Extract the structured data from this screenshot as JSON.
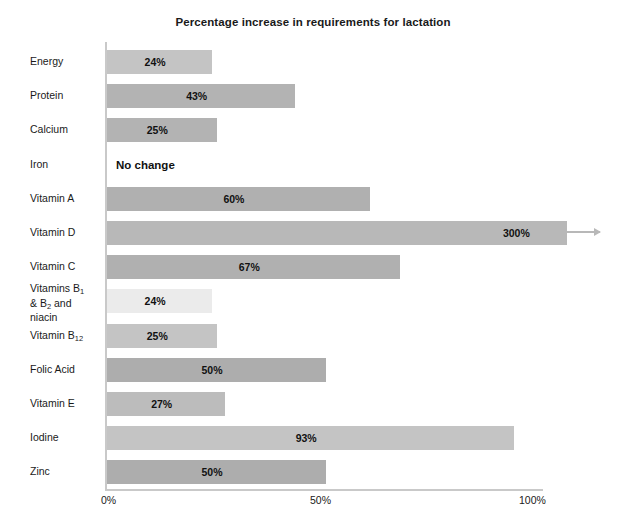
{
  "chart_data": {
    "type": "bar",
    "orientation": "horizontal",
    "title": "Percentage increase in requirements for lactation",
    "xlabel": "",
    "ylabel": "",
    "xlim": [
      0,
      100
    ],
    "grid": false,
    "legend": false,
    "axis_ticks": [
      {
        "value": 0,
        "label": "0%"
      },
      {
        "value": 50,
        "label": "50%"
      },
      {
        "value": 100,
        "label": "100%"
      }
    ],
    "categories": [
      "Energy",
      "Protein",
      "Calcium",
      "Iron",
      "Vitamin A",
      "Vitamin D",
      "Vitamin C",
      "Vitamins B1 & B2 and niacin",
      "Vitamin B12",
      "Folic Acid",
      "Vitamin E",
      "Iodine",
      "Zinc"
    ],
    "values": [
      24,
      43,
      25,
      0,
      60,
      300,
      67,
      24,
      25,
      50,
      27,
      93,
      50
    ],
    "bars": [
      {
        "category": "Energy",
        "value": 24,
        "value_label": "24%",
        "color": "#c4c4c4",
        "overflow": false,
        "no_change": false
      },
      {
        "category": "Protein",
        "value": 43,
        "value_label": "43%",
        "color": "#b3b3b3",
        "overflow": false,
        "no_change": false
      },
      {
        "category": "Calcium",
        "value": 25,
        "value_label": "25%",
        "color": "#b3b3b3",
        "overflow": false,
        "no_change": false
      },
      {
        "category": "Iron",
        "value": 0,
        "value_label": "No change",
        "color": "#ffffff",
        "overflow": false,
        "no_change": true
      },
      {
        "category": "Vitamin A",
        "value": 60,
        "value_label": "60%",
        "color": "#b0b0b0",
        "overflow": false,
        "no_change": false
      },
      {
        "category": "Vitamin D",
        "value": 300,
        "value_label": "300%",
        "color": "#b8b8b8",
        "overflow": true,
        "no_change": false
      },
      {
        "category": "Vitamin C",
        "value": 67,
        "value_label": "67%",
        "color": "#b0b0b0",
        "overflow": false,
        "no_change": false
      },
      {
        "category": "Vitamins B1 & B2 and niacin",
        "value": 24,
        "value_label": "24%",
        "color": "#ebebeb",
        "overflow": false,
        "no_change": false
      },
      {
        "category": "Vitamin B12",
        "value": 25,
        "value_label": "25%",
        "color": "#c4c4c4",
        "overflow": false,
        "no_change": false
      },
      {
        "category": "Folic Acid",
        "value": 50,
        "value_label": "50%",
        "color": "#adadad",
        "overflow": false,
        "no_change": false
      },
      {
        "category": "Vitamin E",
        "value": 27,
        "value_label": "27%",
        "color": "#bcbcbc",
        "overflow": false,
        "no_change": false
      },
      {
        "category": "Iodine",
        "value": 93,
        "value_label": "93%",
        "color": "#c4c4c4",
        "overflow": false,
        "no_change": false
      },
      {
        "category": "Zinc",
        "value": 50,
        "value_label": "50%",
        "color": "#adadad",
        "overflow": false,
        "no_change": false
      }
    ]
  },
  "labels": {
    "row_0": {
      "text": "Energy",
      "html": "Energy"
    },
    "row_1": {
      "text": "Protein",
      "html": "Protein"
    },
    "row_2": {
      "text": "Calcium",
      "html": "Calcium"
    },
    "row_3": {
      "text": "Iron",
      "html": "Iron"
    },
    "row_4": {
      "text": "Vitamin A",
      "html": "Vitamin A"
    },
    "row_5": {
      "text": "Vitamin D",
      "html": "Vitamin D"
    },
    "row_6": {
      "text": "Vitamin C",
      "html": "Vitamin C"
    },
    "row_7": {
      "text": "Vitamins B1 & B2 and niacin",
      "html": "Vitamins B<sub>1</sub><br>&amp; B<sub>2</sub> and<br>niacin"
    },
    "row_8": {
      "text": "Vitamin B12",
      "html": "Vitamin B<sub>12</sub>"
    },
    "row_9": {
      "text": "Folic Acid",
      "html": "Folic Acid"
    },
    "row_10": {
      "text": "Vitamin E",
      "html": "Vitamin E"
    },
    "row_11": {
      "text": "Iodine",
      "html": "Iodine"
    },
    "row_12": {
      "text": "Zinc",
      "html": "Zinc"
    }
  },
  "values": {
    "row_0": "24%",
    "row_1": "43%",
    "row_2": "25%",
    "row_3": "No change",
    "row_4": "60%",
    "row_5": "300%",
    "row_6": "67%",
    "row_7": "24%",
    "row_8": "25%",
    "row_9": "50%",
    "row_10": "27%",
    "row_11": "93%",
    "row_12": "50%"
  },
  "axis": {
    "tick_0": "0%",
    "tick_1": "50%",
    "tick_2": "100%"
  },
  "colors": {
    "axis_line": "#c9c9c9",
    "text": "#1a1a1a",
    "background": "#ffffff"
  }
}
